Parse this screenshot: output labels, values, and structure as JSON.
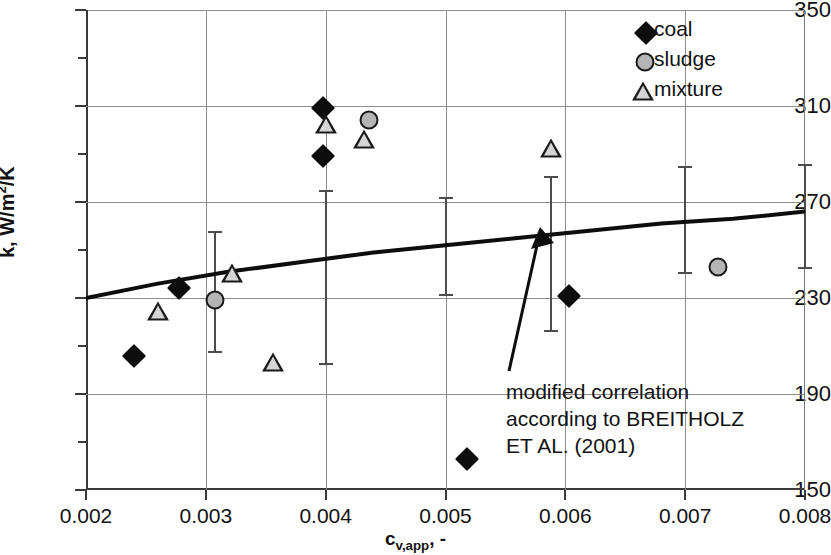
{
  "chart_data": {
    "type": "scatter",
    "title": "",
    "xlabel": "c_v,app, -",
    "ylabel": "k, W/m²/K",
    "xlim": [
      0.002,
      0.008
    ],
    "ylim": [
      150,
      350
    ],
    "x_ticks": [
      0.002,
      0.003,
      0.004,
      0.005,
      0.006,
      0.007,
      0.008
    ],
    "x_tick_labels": [
      "0.002",
      "0.003",
      "0.004",
      "0.005",
      "0.006",
      "0.007",
      "0.008"
    ],
    "y_ticks": [
      150,
      190,
      230,
      270,
      310,
      350
    ],
    "y_tick_labels": [
      "150",
      "190",
      "230",
      "270",
      "310",
      "350"
    ],
    "y_minor_ticks": [
      170,
      210,
      250,
      290,
      330
    ],
    "grid": "major-horizontal-and-vertical",
    "legend_position": "top-right",
    "series": [
      {
        "name": "coal",
        "marker": "filled-diamond",
        "color": "#0d0d0d",
        "points": [
          {
            "x": 0.0024,
            "y": 206
          },
          {
            "x": 0.00278,
            "y": 234
          },
          {
            "x": 0.00398,
            "y": 309
          },
          {
            "x": 0.00398,
            "y": 289
          },
          {
            "x": 0.00518,
            "y": 163
          },
          {
            "x": 0.00603,
            "y": 231
          }
        ]
      },
      {
        "name": "sludge",
        "marker": "filled-circle-gray",
        "color": "#b4b4b4",
        "points": [
          {
            "x": 0.00308,
            "y": 229
          },
          {
            "x": 0.00436,
            "y": 304
          },
          {
            "x": 0.00727,
            "y": 243
          }
        ]
      },
      {
        "name": "mixture",
        "marker": "open-triangle",
        "color": "#d5d5d5",
        "points": [
          {
            "x": 0.0026,
            "y": 224
          },
          {
            "x": 0.00322,
            "y": 240
          },
          {
            "x": 0.00356,
            "y": 203
          },
          {
            "x": 0.004,
            "y": 302
          },
          {
            "x": 0.00432,
            "y": 296
          },
          {
            "x": 0.00588,
            "y": 292
          }
        ]
      }
    ],
    "error_bars": [
      {
        "x": 0.00308,
        "low": 207,
        "high": 258
      },
      {
        "x": 0.004,
        "low": 202,
        "high": 275
      },
      {
        "x": 0.005,
        "low": 231,
        "high": 272
      },
      {
        "x": 0.00588,
        "low": 216,
        "high": 281
      },
      {
        "x": 0.007,
        "low": 240,
        "high": 285
      },
      {
        "x": 0.008,
        "low": 242,
        "high": 286
      }
    ],
    "curve": {
      "name": "modified correlation according to BREITHOLZ ET AL. (2001)",
      "color": "#0d0d0d",
      "points": [
        {
          "x": 0.002,
          "y": 230
        },
        {
          "x": 0.0026,
          "y": 236
        },
        {
          "x": 0.0032,
          "y": 241
        },
        {
          "x": 0.0038,
          "y": 245
        },
        {
          "x": 0.0044,
          "y": 249
        },
        {
          "x": 0.005,
          "y": 252
        },
        {
          "x": 0.0056,
          "y": 255
        },
        {
          "x": 0.0062,
          "y": 258
        },
        {
          "x": 0.0068,
          "y": 261
        },
        {
          "x": 0.0074,
          "y": 263
        },
        {
          "x": 0.008,
          "y": 266
        }
      ]
    },
    "annotation": {
      "lines": [
        "modified correlation",
        "according to BREITHOLZ",
        "ET AL. (2001)"
      ],
      "arrow_from": {
        "x": 0.0056,
        "y": 203
      },
      "arrow_to": {
        "x": 0.00566,
        "y": 255
      }
    }
  },
  "legend": {
    "items": [
      {
        "label": "coal",
        "icon": "filled-diamond-icon"
      },
      {
        "label": "sludge",
        "icon": "gray-circle-icon"
      },
      {
        "label": "mixture",
        "icon": "open-triangle-icon"
      }
    ]
  },
  "axis_titles": {
    "y": "k, W/m²/K",
    "y_prefix": "k, W/m",
    "y_sup": "2",
    "y_suffix": "/K",
    "x_prefix": "c",
    "x_sub": "v,app",
    "x_suffix": ", -"
  }
}
